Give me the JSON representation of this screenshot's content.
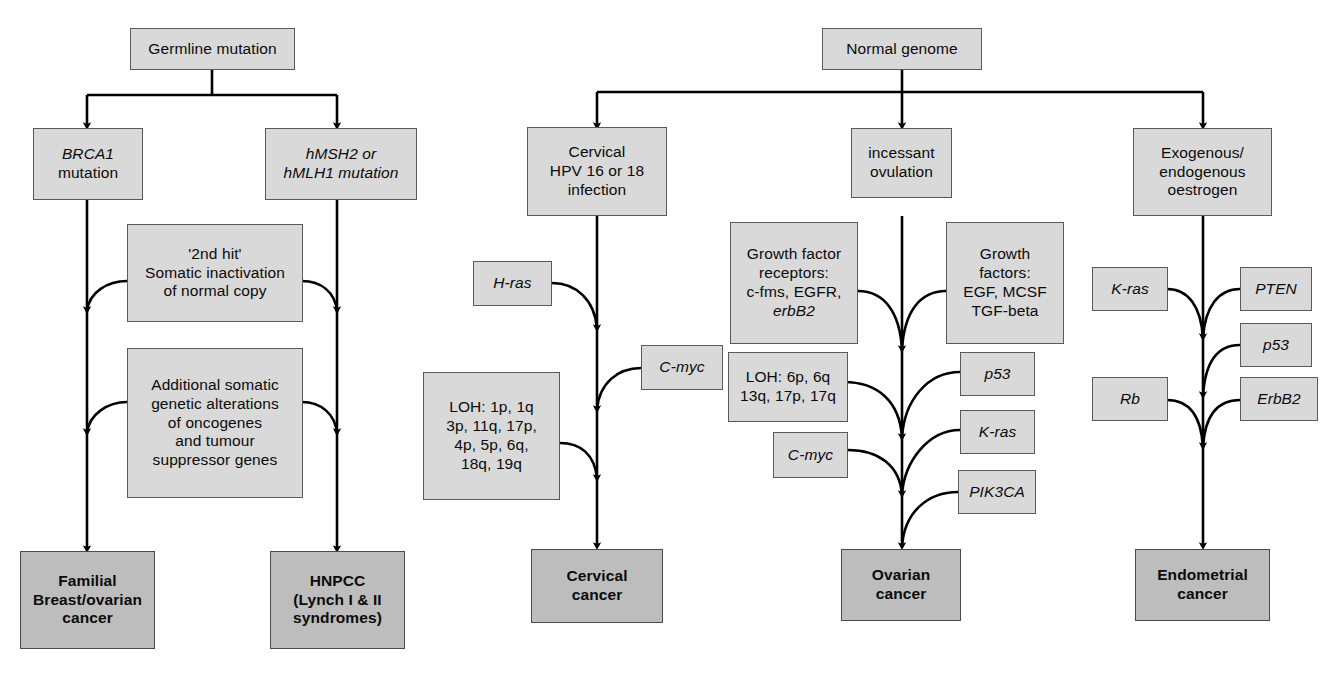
{
  "diagram": {
    "colors": {
      "box_fill": "#d9d9d9",
      "outcome_fill": "#bdbdbd",
      "border": "#5a5a5a",
      "line": "#000000",
      "background": "#ffffff"
    },
    "roots": [
      {
        "id": "germline-mutation",
        "label": "Germline mutation"
      },
      {
        "id": "normal-genome",
        "label": "Normal genome"
      }
    ],
    "hereditary": {
      "brca1": {
        "line1": "BRCA1",
        "line2": "mutation"
      },
      "hmsh2": {
        "line1": "hMSH2 or",
        "line2": "hMLH1 mutation"
      },
      "second_hit": {
        "line1": "'2nd hit'",
        "line2": "Somatic inactivation",
        "line3": "of normal copy"
      },
      "additional": {
        "line1": "Additional somatic",
        "line2": "genetic alterations",
        "line3": "of oncogenes",
        "line4": "and tumour",
        "line5": "suppressor genes"
      },
      "outcome_left": {
        "line1": "Familial",
        "line2": "Breast/ovarian",
        "line3": "cancer"
      },
      "outcome_right": {
        "line1": "HNPCC",
        "line2": "(Lynch I & II",
        "line3": "syndromes)"
      }
    },
    "cervical": {
      "initiator": {
        "line1": "Cervical",
        "line2": "HPV 16 or 18",
        "line3": "infection"
      },
      "h_ras": "H-ras",
      "c_myc": "C-myc",
      "loh": {
        "line1": "LOH: 1p, 1q",
        "line2": "3p, 11q, 17p,",
        "line3": "4p, 5p, 6q,",
        "line4": "18q, 19q"
      },
      "outcome": {
        "line1": "Cervical",
        "line2": "cancer"
      }
    },
    "ovarian": {
      "initiator": {
        "line1": "incessant",
        "line2": "ovulation"
      },
      "gf_receptors": {
        "line1": "Growth factor",
        "line2": "receptors:",
        "line3": "c-fms, EGFR,",
        "line4": "erbB2"
      },
      "growth_factors": {
        "line1": "Growth",
        "line2": "factors:",
        "line3": "EGF, MCSF",
        "line4": "TGF-beta"
      },
      "loh": {
        "line1": "LOH: 6p, 6q",
        "line2": "13q, 17p, 17q"
      },
      "c_myc": "C-myc",
      "p53": "p53",
      "k_ras": "K-ras",
      "pik3ca": "PIK3CA",
      "outcome": {
        "line1": "Ovarian",
        "line2": "cancer"
      }
    },
    "endometrial": {
      "initiator": {
        "line1": "Exogenous/",
        "line2": "endogenous",
        "line3": "oestrogen"
      },
      "k_ras": "K-ras",
      "pten": "PTEN",
      "p53": "p53",
      "rb": "Rb",
      "erbb2": "ErbB2",
      "outcome": {
        "line1": "Endometrial",
        "line2": "cancer"
      }
    }
  }
}
